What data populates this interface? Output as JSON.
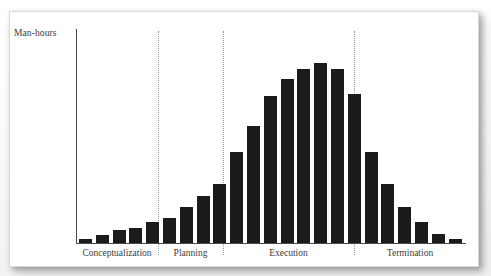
{
  "figure": {
    "background_color": "#ffffff",
    "card_color": "#ffffff",
    "border_color": "#d8d8d8"
  },
  "axis": {
    "y_label": "Man-hours",
    "axis_color": "#4a4a4a",
    "baseline_y_px": 243,
    "y_axis_x_px": 76
  },
  "phases": [
    {
      "name": "conceptualization",
      "label": "Conceptualization",
      "center_px": 117,
      "start_px": 76,
      "end_px": 158
    },
    {
      "name": "planning",
      "label": "Planning",
      "center_px": 190,
      "start_px": 158,
      "end_px": 223
    },
    {
      "name": "execution",
      "label": "Execution",
      "center_px": 289,
      "start_px": 223,
      "end_px": 354
    },
    {
      "name": "termination",
      "label": "Termination",
      "center_px": 410,
      "start_px": 354,
      "end_px": 466
    }
  ],
  "dividers": {
    "color": "#9a9a9a",
    "style": "dotted",
    "positions_px": [
      158,
      223,
      354
    ]
  },
  "chart_data": {
    "type": "bar",
    "title": "",
    "subtitle": "",
    "xlabel": "",
    "ylabel": "Man-hours",
    "grid": false,
    "legend": null,
    "bar_color": "#1b1b1b",
    "bar_width_px": 13,
    "bar_pitch_px": 16.8,
    "axis_ranges": {
      "ylim": [
        0,
        100
      ],
      "xlim": [
        0,
        23
      ]
    },
    "categories": [
      "1",
      "2",
      "3",
      "4",
      "5",
      "6",
      "7",
      "8",
      "9",
      "10",
      "11",
      "12",
      "13",
      "14",
      "15",
      "16",
      "17",
      "18",
      "19",
      "20",
      "21",
      "22",
      "23"
    ],
    "phase_of_bar": [
      "Conceptualization",
      "Conceptualization",
      "Conceptualization",
      "Conceptualization",
      "Conceptualization",
      "Planning",
      "Planning",
      "Planning",
      "Planning",
      "Execution",
      "Execution",
      "Execution",
      "Execution",
      "Execution",
      "Execution",
      "Execution",
      "Execution",
      "Termination",
      "Termination",
      "Termination",
      "Termination",
      "Termination",
      "Termination"
    ],
    "values": [
      2,
      4,
      7,
      8,
      11,
      13,
      19,
      25,
      31,
      48,
      62,
      78,
      87,
      92,
      95,
      92,
      79,
      48,
      31,
      19,
      11,
      5,
      2
    ],
    "values_px": [
      4,
      8,
      13,
      15,
      21,
      25,
      36,
      47,
      59,
      91,
      117,
      147,
      164,
      174,
      180,
      174,
      149,
      91,
      59,
      36,
      21,
      9,
      4
    ],
    "max_value": 95,
    "peak_category": "15",
    "peak_phase": "Execution"
  }
}
